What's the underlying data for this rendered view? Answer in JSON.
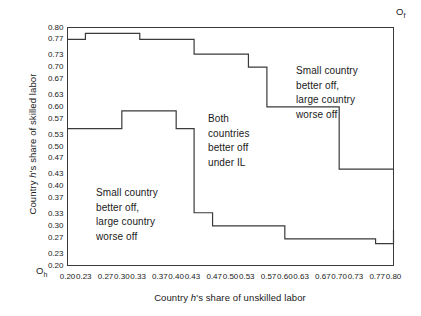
{
  "axes": {
    "x_title_pre": "Country ",
    "x_title_ital": "h",
    "x_title_post": "'s share of unskilled labor",
    "y_title_pre": "Country ",
    "y_title_ital": "h",
    "y_title_post": "'s share of skilled labor",
    "origin_h": "O",
    "origin_h_sub": "h",
    "origin_f": "O",
    "origin_f_sub": "f"
  },
  "chart_data": {
    "type": "line",
    "title": "",
    "xlabel": "Country h's share of unskilled labor",
    "ylabel": "Country h's share of skilled labor",
    "xlim": [
      0.2,
      0.8
    ],
    "ylim": [
      0.2,
      0.8
    ],
    "grid": false,
    "legend": "none",
    "xticks": [
      "0.20",
      "0.23",
      "0.27",
      "0.30",
      "0.33",
      "0.37",
      "0.40",
      "0.43",
      "0.47",
      "0.50",
      "0.53",
      "0.57",
      "0.60",
      "0.63",
      "0.67",
      "0.70",
      "0.73",
      "0.77",
      "0.80"
    ],
    "yticks": [
      "0.80",
      "0.77",
      "0.73",
      "0.70",
      "0.67",
      "0.63",
      "0.60",
      "0.57",
      "0.53",
      "0.50",
      "0.47",
      "0.43",
      "0.40",
      "0.37",
      "0.33",
      "0.30",
      "0.27",
      "0.23",
      "0.20"
    ],
    "xtick_values": [
      0.2,
      0.23,
      0.27,
      0.3,
      0.33,
      0.37,
      0.4,
      0.43,
      0.47,
      0.5,
      0.53,
      0.57,
      0.6,
      0.63,
      0.67,
      0.7,
      0.73,
      0.77,
      0.8
    ],
    "ytick_values": [
      0.8,
      0.77,
      0.73,
      0.7,
      0.67,
      0.63,
      0.6,
      0.57,
      0.53,
      0.5,
      0.47,
      0.43,
      0.4,
      0.37,
      0.33,
      0.3,
      0.27,
      0.23,
      0.2
    ],
    "series": [
      {
        "name": "upper-boundary",
        "step": "post",
        "x": [
          0.2,
          0.233,
          0.333,
          0.433,
          0.5,
          0.533,
          0.567,
          0.633,
          0.7,
          0.733,
          0.8
        ],
        "y": [
          0.77,
          0.785,
          0.77,
          0.733,
          0.733,
          0.7,
          0.6,
          0.6,
          0.443,
          0.443,
          0.443
        ]
      },
      {
        "name": "lower-boundary",
        "step": "post",
        "x": [
          0.2,
          0.3,
          0.4,
          0.433,
          0.467,
          0.5,
          0.6,
          0.633,
          0.767,
          0.8
        ],
        "y": [
          0.545,
          0.59,
          0.545,
          0.333,
          0.3,
          0.3,
          0.267,
          0.267,
          0.255,
          0.29
        ]
      }
    ],
    "annotations": [
      {
        "text": "Small country\nbetter off,\nlarge country\nworse off",
        "x": 0.345,
        "y": 0.4
      },
      {
        "text": "Both\ncountries\nbetter off\nunder IL",
        "x": 0.552,
        "y": 0.585
      },
      {
        "text": "Small country\nbetter off,\nlarge country\nworse off",
        "x": 0.712,
        "y": 0.705
      }
    ]
  }
}
